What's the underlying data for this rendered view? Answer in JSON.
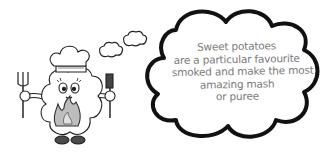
{
  "illustration": {
    "subject": "smoke-cloud chef character holding fork and spatula over flames",
    "thought_bubble": {
      "lines": [
        "Sweet potatoes",
        "are a particular favourite",
        "smoked and make the most",
        "amazing mash",
        "or puree"
      ]
    }
  },
  "colors": {
    "outline": "#111111",
    "text": "#7a7a7a",
    "flame": "#bdbdbd",
    "shoes": "#4a4a4a",
    "background": "#ffffff"
  }
}
